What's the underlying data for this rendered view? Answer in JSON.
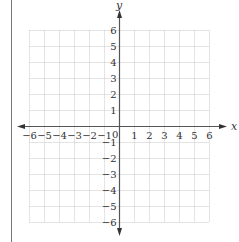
{
  "figure": {
    "type": "coordinate-grid",
    "x_axis": {
      "label": "x",
      "min": -6,
      "max": 6,
      "ticks": [
        "−6",
        "−5",
        "−4",
        "−3",
        "−2",
        "−1",
        "1",
        "2",
        "3",
        "4",
        "5",
        "6"
      ],
      "tick_values": [
        -6,
        -5,
        -4,
        -3,
        -2,
        -1,
        1,
        2,
        3,
        4,
        5,
        6
      ]
    },
    "y_axis": {
      "label": "y",
      "min": -6,
      "max": 6,
      "ticks": [
        "6",
        "5",
        "4",
        "3",
        "2",
        "1",
        "−1",
        "−2",
        "−3",
        "−4",
        "−5",
        "−6"
      ],
      "tick_values": [
        6,
        5,
        4,
        3,
        2,
        1,
        -1,
        -2,
        -3,
        -4,
        -5,
        -6
      ]
    },
    "origin_label": "0",
    "grid": {
      "style": "dotted",
      "step": 1
    },
    "colors": {
      "axis": "#555555",
      "grid": "#bbbbbb",
      "border": "#777777",
      "text": "#333333"
    }
  }
}
